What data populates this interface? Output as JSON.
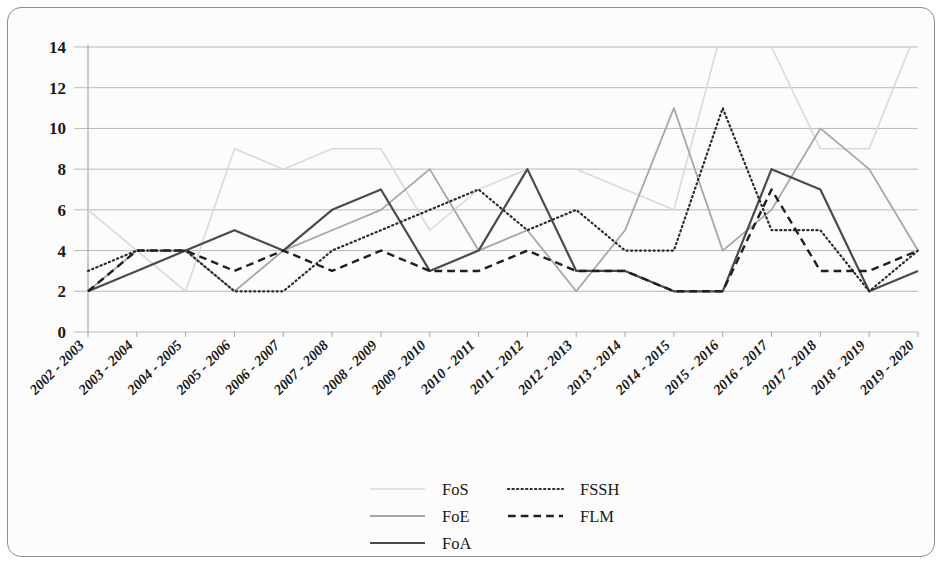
{
  "figure": {
    "frame_border_color": "#8d8d8d",
    "background_color": "#fcfcfc",
    "grid_color": "#b9b9b9",
    "axis_color": "#a8a8a8"
  },
  "chart_data": {
    "type": "line",
    "title": "",
    "subtitle": "",
    "xlabel": "",
    "ylabel": "",
    "grid": true,
    "grid_axis": "y",
    "legend_position": "bottom",
    "ylim": [
      0,
      14
    ],
    "yticks": [
      0,
      2,
      4,
      6,
      8,
      10,
      12,
      14
    ],
    "ytick_labels": [
      "0",
      "2",
      "4",
      "6",
      "8",
      "10",
      "12",
      "14"
    ],
    "categories": [
      "2002 - 2003",
      "2003 - 2004",
      "2004 - 2005",
      "2005 - 2006",
      "2006 - 2007",
      "2007 - 2008",
      "2008 - 2009",
      "2009 - 2010",
      "2010 - 2011",
      "2011 - 2012",
      "2012 - 2013",
      "2013 - 2014",
      "2014 - 2015",
      "2015 - 2016",
      "2016 - 2017",
      "2017 - 2018",
      "2018 - 2019",
      "2019 - 2020"
    ],
    "series": [
      {
        "name": "FoS",
        "style": "solid",
        "color": "#d9d9d9",
        "width": 1.6,
        "values": [
          6,
          4,
          2,
          9,
          8,
          9,
          9,
          5,
          7,
          8,
          8,
          7,
          6,
          15,
          14,
          9,
          9,
          15
        ]
      },
      {
        "name": "FoE",
        "style": "solid",
        "color": "#a6a6a6",
        "width": 1.8,
        "values": [
          2,
          4,
          4,
          2,
          4,
          5,
          6,
          8,
          4,
          5,
          2,
          5,
          11,
          4,
          6,
          10,
          8,
          4
        ]
      },
      {
        "name": "FoA",
        "style": "solid",
        "color": "#4a4a4a",
        "width": 2.2,
        "values": [
          2,
          3,
          4,
          5,
          4,
          6,
          7,
          3,
          4,
          8,
          3,
          3,
          2,
          2,
          8,
          7,
          2,
          3
        ]
      },
      {
        "name": "FSSH",
        "style": "dotted",
        "color": "#2b2b2b",
        "width": 2.2,
        "values": [
          3,
          4,
          4,
          2,
          2,
          4,
          5,
          6,
          7,
          5,
          6,
          4,
          4,
          11,
          5,
          5,
          2,
          4
        ]
      },
      {
        "name": "FLM",
        "style": "dashed",
        "color": "#1f1f1f",
        "width": 2.4,
        "values": [
          2,
          4,
          4,
          3,
          4,
          3,
          4,
          3,
          3,
          4,
          3,
          3,
          2,
          2,
          7,
          3,
          3,
          4
        ]
      }
    ]
  },
  "legend": {
    "entries": [
      {
        "label": "FoS",
        "sample": "solid-light"
      },
      {
        "label": "FoE",
        "sample": "solid-gray"
      },
      {
        "label": "FoA",
        "sample": "solid-dark"
      },
      {
        "label": "FSSH",
        "sample": "dotted"
      },
      {
        "label": "FLM",
        "sample": "dashed"
      }
    ]
  }
}
